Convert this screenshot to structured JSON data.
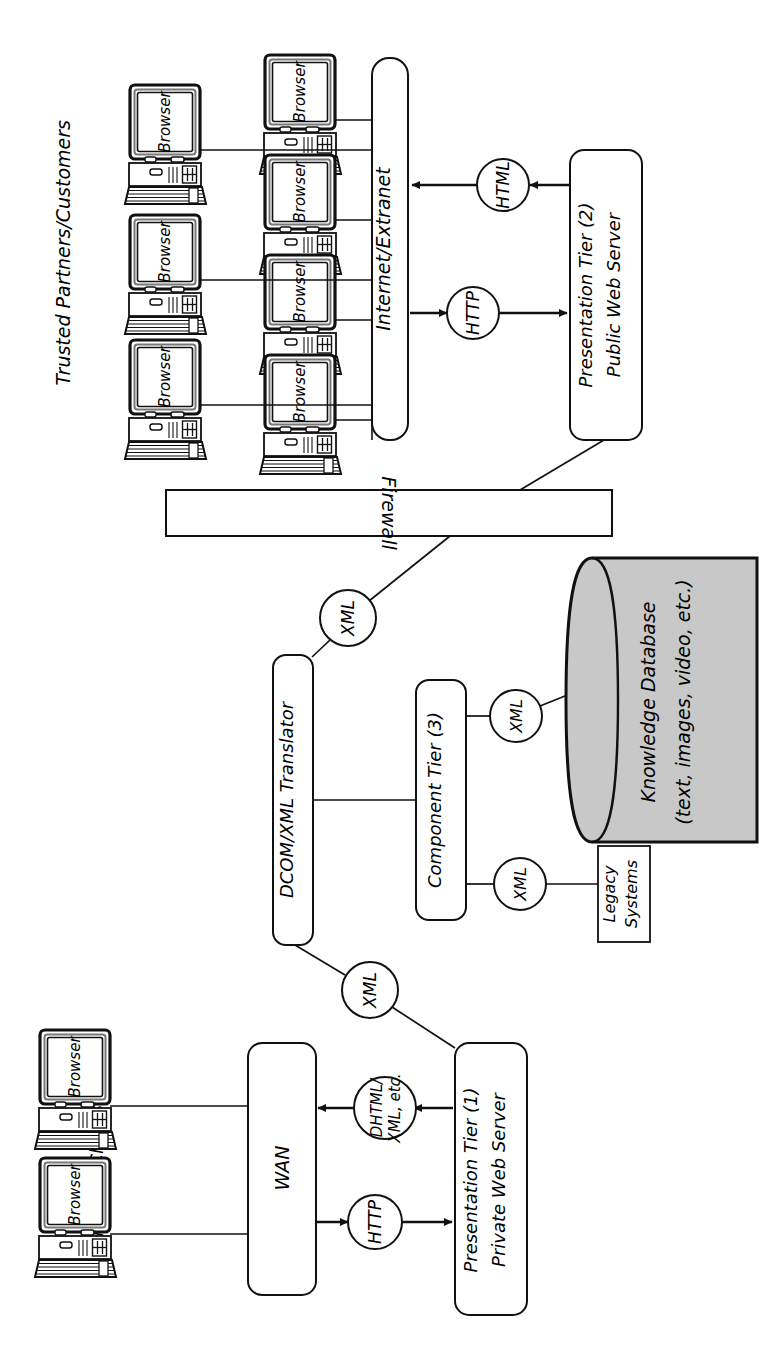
{
  "diagram": {
    "orientation": "rotated-90-clockwise",
    "stroke_color": "#111111",
    "database_fill": "#c8c8c8",
    "background": "#ffffff"
  },
  "groups": {
    "trusted": {
      "label": "Trusted Partners/Customers"
    },
    "internal": {
      "label": "Internal Clients"
    }
  },
  "clients": {
    "screen_label": "Browser",
    "trusted_outer_count": 3,
    "trusted_inner_count": 4,
    "internal_count": 2
  },
  "nodes": {
    "internet": {
      "label": "Internet/Extranet"
    },
    "firewall": {
      "label": "Firewall"
    },
    "wan": {
      "label": "WAN"
    },
    "presentation_public": {
      "line1": "Presentation Tier (2)",
      "line2": "Public Web Server"
    },
    "presentation_private": {
      "line1": "Presentation Tier (1)",
      "line2": "Private Web Server"
    },
    "translator": {
      "label": "DCOM/XML Translator"
    },
    "component_tier": {
      "label": "Component Tier (3)"
    },
    "legacy": {
      "line1": "Legacy",
      "line2": "Systems"
    },
    "database": {
      "line1": "Knowledge Database",
      "line2": "(text, images, video, etc.)"
    }
  },
  "protocols": {
    "http_public": {
      "label": "HTTP"
    },
    "html_public": {
      "label": "HTML"
    },
    "http_private": {
      "label": "HTTP"
    },
    "dhtml_private": {
      "line1": "DHTML/",
      "line2": "XML, etc."
    },
    "xml_firewall": {
      "label": "XML"
    },
    "xml_private": {
      "label": "XML"
    },
    "xml_database": {
      "label": "XML"
    },
    "xml_legacy": {
      "label": "XML"
    }
  },
  "flows": [
    {
      "from": "Internet/Extranet",
      "via": "HTTP",
      "to": "Presentation Tier (2) Public Web Server",
      "direction": "request"
    },
    {
      "from": "Presentation Tier (2) Public Web Server",
      "via": "HTML",
      "to": "Internet/Extranet",
      "direction": "response"
    },
    {
      "from": "Presentation Tier (2) Public Web Server",
      "to": "Firewall",
      "direction": "both"
    },
    {
      "from": "Firewall",
      "via": "XML",
      "to": "DCOM/XML Translator",
      "direction": "both"
    },
    {
      "from": "DCOM/XML Translator",
      "to": "Component Tier (3)",
      "direction": "both"
    },
    {
      "from": "Component Tier (3)",
      "via": "XML",
      "to": "Knowledge Database",
      "direction": "both"
    },
    {
      "from": "Component Tier (3)",
      "via": "XML",
      "to": "Legacy Systems",
      "direction": "both"
    },
    {
      "from": "DCOM/XML Translator",
      "via": "XML",
      "to": "Presentation Tier (1) Private Web Server",
      "direction": "both"
    },
    {
      "from": "WAN",
      "via": "HTTP",
      "to": "Presentation Tier (1) Private Web Server",
      "direction": "request"
    },
    {
      "from": "Presentation Tier (1) Private Web Server",
      "via": "DHTML/XML, etc.",
      "to": "WAN",
      "direction": "response"
    }
  ]
}
